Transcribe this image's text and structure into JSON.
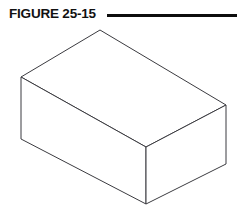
{
  "page": {
    "width": 244,
    "height": 218,
    "background_color": "#ffffff"
  },
  "header": {
    "figure_label": "FIGURE 25-15",
    "rule": {
      "name": "horizontal-rule",
      "color": "#0d0d0d",
      "x": 107,
      "y": 14,
      "width": 130,
      "height": 3
    }
  },
  "figure": {
    "caption": "FIGURE 25-15",
    "illustration_type": "line-drawing",
    "stroke_color": "#3b3b40",
    "fill_color": "#ffffff",
    "stroke_width": 1,
    "vertices": {
      "top_back": [
        100,
        30
      ],
      "top_left": [
        21,
        77
      ],
      "top_right": [
        226,
        105
      ],
      "top_front": [
        146,
        147
      ],
      "bottom_left": [
        21,
        139
      ],
      "bottom_front": [
        146,
        204
      ],
      "bottom_right": [
        226,
        164
      ]
    },
    "faces": [
      {
        "name": "top-face",
        "points": "100,30 226,105 146,147 21,77"
      },
      {
        "name": "left-face",
        "points": "21,77 146,147 146,204 21,139"
      },
      {
        "name": "right-face",
        "points": "146,147 226,105 226,164 146,204"
      }
    ]
  }
}
